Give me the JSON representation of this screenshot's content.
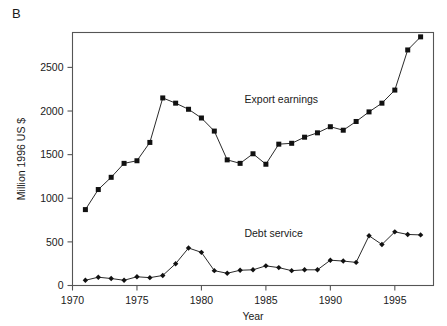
{
  "panel": {
    "label": "B"
  },
  "chart_data": {
    "type": "line",
    "title": "",
    "subtitle": "",
    "xlabel": "Year",
    "ylabel": "Million 1996 US $",
    "xlim": [
      1970,
      1998
    ],
    "ylim": [
      0,
      2900
    ],
    "grid": false,
    "legend_position": "inline-annotations",
    "xticks": [
      1970,
      1975,
      1980,
      1985,
      1990,
      1995
    ],
    "xtick_labels": [
      "1970",
      "1975",
      "1980",
      "1985",
      "1990",
      "1995"
    ],
    "yticks": [
      0,
      500,
      1000,
      1500,
      2000,
      2500
    ],
    "ytick_labels": [
      "0",
      "500",
      "1000",
      "1500",
      "2000",
      "2500"
    ],
    "marker_style": "filled-square",
    "series": [
      {
        "name": "Export earnings",
        "label_x": 1986.2,
        "label_y": 2090,
        "marker": "square",
        "color": "#111111",
        "x": [
          1971,
          1972,
          1973,
          1974,
          1975,
          1976,
          1977,
          1978,
          1979,
          1980,
          1981,
          1982,
          1983,
          1984,
          1985,
          1986,
          1987,
          1988,
          1989,
          1990,
          1991,
          1992,
          1993,
          1994,
          1995,
          1996,
          1997
        ],
        "values": [
          870,
          1100,
          1240,
          1400,
          1430,
          1640,
          2150,
          2090,
          2020,
          1920,
          1770,
          1440,
          1400,
          1510,
          1390,
          1620,
          1630,
          1700,
          1750,
          1820,
          1780,
          1880,
          1990,
          2090,
          2240,
          2700,
          2850
        ]
      },
      {
        "name": "Debt service",
        "label_x": 1985.6,
        "label_y": 560,
        "marker": "diamond",
        "color": "#111111",
        "x": [
          1971,
          1972,
          1973,
          1974,
          1975,
          1976,
          1977,
          1978,
          1979,
          1980,
          1981,
          1982,
          1983,
          1984,
          1985,
          1986,
          1987,
          1988,
          1989,
          1990,
          1991,
          1992,
          1993,
          1994,
          1995,
          1996,
          1997
        ],
        "values": [
          60,
          95,
          80,
          60,
          100,
          90,
          115,
          250,
          430,
          380,
          170,
          140,
          175,
          180,
          225,
          205,
          170,
          180,
          180,
          290,
          280,
          265,
          570,
          470,
          615,
          585,
          580
        ]
      }
    ]
  }
}
